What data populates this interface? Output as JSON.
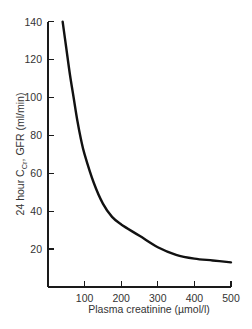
{
  "chart_data": {
    "type": "line",
    "title": "",
    "xlabel": "Plasma creatinine (µmol/l)",
    "ylabel": {
      "prefix": "24 hour C",
      "subscript": "Cr",
      "suffix": ", GFR (ml/min)"
    },
    "xlim": [
      0,
      500
    ],
    "ylim": [
      0,
      140
    ],
    "xticks": [
      "100",
      "200",
      "300",
      "400",
      "500"
    ],
    "yticks": [
      "20",
      "40",
      "60",
      "80",
      "100",
      "120",
      "140"
    ],
    "grid": false,
    "legend": null,
    "series": [
      {
        "name": "GFR vs plasma creatinine",
        "x": [
          40,
          50,
          60,
          70,
          80,
          90,
          100,
          125,
          150,
          175,
          200,
          250,
          300,
          350,
          400,
          450,
          500
        ],
        "y": [
          140,
          126,
          112,
          100,
          88,
          78,
          70,
          55,
          44,
          37,
          33,
          27,
          21,
          17,
          15,
          14,
          13
        ],
        "color": "#111111"
      }
    ]
  }
}
